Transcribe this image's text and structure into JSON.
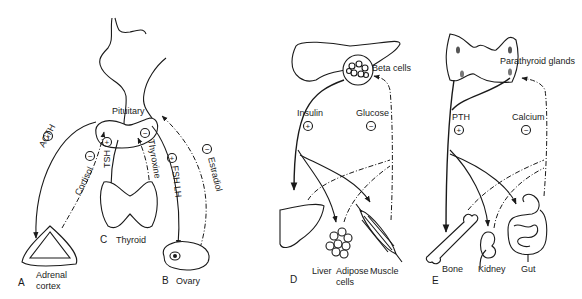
{
  "panels": {
    "A": {
      "letter": "A",
      "organ_line1": "Adrenal",
      "organ_line2": "cortex"
    },
    "B": {
      "letter": "B",
      "organ": "Ovary"
    },
    "C": {
      "letter": "C",
      "organ": "Thyroid"
    },
    "D": {
      "letter": "D"
    },
    "E": {
      "letter": "E"
    }
  },
  "pituitary": {
    "label": "Pituitary"
  },
  "hormones_left": {
    "acth": {
      "name": "ACTH",
      "sign": "+"
    },
    "cortisol": {
      "name": "Cortisol",
      "sign": "−"
    },
    "tsh": {
      "name": "TSH",
      "sign": "+"
    },
    "thyroxine": {
      "name": "Thyroxine",
      "sign": "−"
    },
    "fsh_lh": {
      "name": "FSH  LH",
      "sign": "+"
    },
    "estradiol": {
      "name": "Estradiol",
      "sign": "−"
    }
  },
  "pancreas": {
    "beta_cells": "Beta cells",
    "insulin": {
      "name": "Insulin",
      "sign": "+"
    },
    "glucose": {
      "name": "Glucose",
      "sign": "−"
    },
    "targets": [
      "Liver",
      "Adipose",
      "cells",
      "Muscle"
    ]
  },
  "parathyroid": {
    "glands": "Parathyroid glands",
    "pth": {
      "name": "PTH",
      "sign": "+"
    },
    "calcium": {
      "name": "Calcium",
      "sign": "−"
    },
    "targets": [
      "Bone",
      "Kidney",
      "Gut"
    ]
  },
  "colors": {
    "ink": "#1a1a1a",
    "background": "#ffffff"
  }
}
